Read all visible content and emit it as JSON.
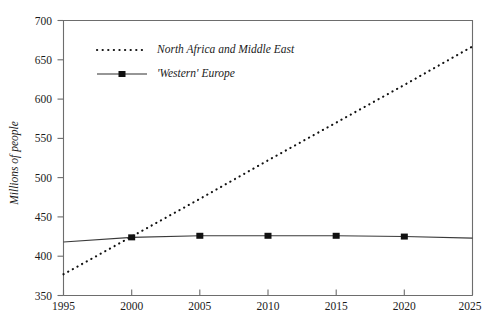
{
  "chart_data": {
    "type": "line",
    "title": "",
    "xlabel": "",
    "ylabel": "Millions of people",
    "x": [
      1995,
      2000,
      2005,
      2010,
      2015,
      2020,
      2025
    ],
    "xlim": [
      1995,
      2025
    ],
    "ylim": [
      350,
      700
    ],
    "y_ticks": [
      350,
      400,
      450,
      500,
      550,
      600,
      650,
      700
    ],
    "x_ticks": [
      1995,
      2000,
      2005,
      2010,
      2015,
      2020,
      2025
    ],
    "grid": false,
    "legend_position": "upper-left-inside",
    "series": [
      {
        "name": "North Africa and Middle East",
        "style": "dotted",
        "marker": "none",
        "values": [
          377,
          425,
          473,
          522,
          570,
          618,
          667
        ]
      },
      {
        "name": "'Western' Europe",
        "style": "solid",
        "marker": "square",
        "values": [
          418,
          424,
          426,
          426,
          426,
          425,
          423
        ]
      }
    ]
  },
  "axes": {
    "y_tick_labels": [
      "700",
      "650",
      "600",
      "550",
      "500",
      "450",
      "400",
      "350"
    ],
    "x_tick_labels": [
      "1995",
      "2000",
      "2005",
      "2010",
      "2015",
      "2020",
      "2025"
    ],
    "y_axis_title": "Millions of people"
  },
  "legend": {
    "entries": [
      {
        "label": "North Africa and Middle East",
        "swatch": "dotted-line-swatch"
      },
      {
        "label": "'Western' Europe",
        "swatch": "solid-line-square-marker-swatch"
      }
    ]
  },
  "colors": {
    "series_north_africa": "#111111",
    "series_western_europe": "#3a3a3a",
    "axis": "#6d6d6d",
    "text": "#1b1b1b",
    "background": "#ffffff"
  }
}
